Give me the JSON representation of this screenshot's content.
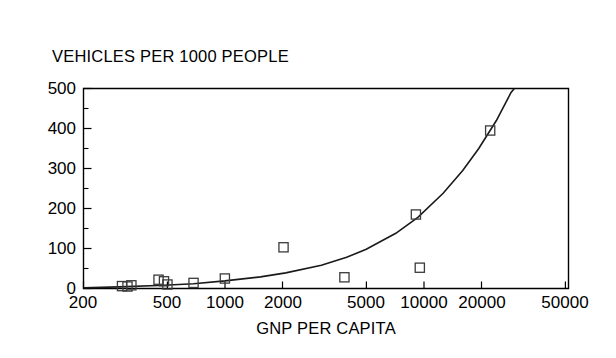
{
  "chart_data": {
    "type": "scatter",
    "title": "",
    "ylabel": "VEHICLES PER 1000 PEOPLE",
    "xlabel": "GNP PER CAPITA",
    "xscale": "log",
    "yscale": "linear",
    "xlim": [
      200,
      50000
    ],
    "ylim": [
      0,
      500
    ],
    "grid": false,
    "legend": null,
    "xticks": [
      200,
      500,
      1000,
      2000,
      5000,
      10000,
      20000,
      50000
    ],
    "xtick_labels": [
      "200",
      "500",
      "1000",
      "2000",
      "5000",
      "10000",
      "20000",
      "50000"
    ],
    "yticks": [
      0,
      100,
      200,
      300,
      400,
      500
    ],
    "ytick_labels": [
      "0",
      "100",
      "200",
      "300",
      "400",
      "500"
    ],
    "yminor_ticks": [
      50,
      150,
      250,
      350,
      450
    ],
    "marker": "open-square",
    "points": [
      {
        "x": 310,
        "y": 6
      },
      {
        "x": 330,
        "y": 5
      },
      {
        "x": 345,
        "y": 8
      },
      {
        "x": 470,
        "y": 22
      },
      {
        "x": 500,
        "y": 18
      },
      {
        "x": 520,
        "y": 10
      },
      {
        "x": 700,
        "y": 14
      },
      {
        "x": 1000,
        "y": 25
      },
      {
        "x": 1950,
        "y": 103
      },
      {
        "x": 3900,
        "y": 28
      },
      {
        "x": 8800,
        "y": 185
      },
      {
        "x": 9200,
        "y": 52
      },
      {
        "x": 20500,
        "y": 395
      }
    ],
    "fit_curve": {
      "description": "fitted rising exponential trend line",
      "points": [
        {
          "x": 200,
          "y": 2
        },
        {
          "x": 300,
          "y": 4
        },
        {
          "x": 500,
          "y": 8
        },
        {
          "x": 700,
          "y": 12
        },
        {
          "x": 1000,
          "y": 19
        },
        {
          "x": 1500,
          "y": 29
        },
        {
          "x": 2000,
          "y": 39
        },
        {
          "x": 3000,
          "y": 58
        },
        {
          "x": 4000,
          "y": 78
        },
        {
          "x": 5000,
          "y": 98
        },
        {
          "x": 7000,
          "y": 138
        },
        {
          "x": 9000,
          "y": 178
        },
        {
          "x": 12000,
          "y": 238
        },
        {
          "x": 15000,
          "y": 295
        },
        {
          "x": 18000,
          "y": 350
        },
        {
          "x": 22000,
          "y": 420
        },
        {
          "x": 26000,
          "y": 490
        },
        {
          "x": 27000,
          "y": 500
        }
      ]
    }
  },
  "labels": {
    "header": "VEHICLES PER 1000 PEOPLE",
    "xaxis_title": "GNP PER CAPITA",
    "y0": "0",
    "y100": "100",
    "y200": "200",
    "y300": "300",
    "y400": "400",
    "y500": "500",
    "x200": "200",
    "x500": "500",
    "x1000": "1000",
    "x2000": "2000",
    "x5000": "5000",
    "x10000": "10000",
    "x20000": "20000",
    "x50000": "50000"
  },
  "colors": {
    "axis": "#000000",
    "curve": "#1a1a1a",
    "marker": "#3b3b3b",
    "background": "#ffffff"
  }
}
